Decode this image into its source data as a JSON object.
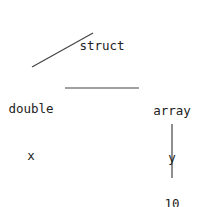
{
  "diagram": {
    "type": "type-tree",
    "colors": {
      "text": "#222222",
      "edge": "#444444",
      "background": "#ffffff"
    },
    "nodes": {
      "root": {
        "id": "root",
        "lines": [
          "struct"
        ]
      },
      "field_x": {
        "id": "field_x",
        "lines": [
          "double",
          "x"
        ]
      },
      "field_y": {
        "id": "field_y",
        "lines": [
          "array",
          "y",
          "10"
        ]
      },
      "elem": {
        "id": "elem",
        "lines": [
          "int"
        ]
      }
    },
    "labels": {
      "root_type": "struct",
      "x_type": "double",
      "x_name": "x",
      "y_type": "array",
      "y_name": "y",
      "y_size": "10",
      "elem_type": "int"
    },
    "edges": [
      {
        "from": "root",
        "to": "field_x"
      },
      {
        "from": "field_x",
        "to": "field_y"
      },
      {
        "from": "field_y",
        "to": "elem"
      }
    ]
  }
}
